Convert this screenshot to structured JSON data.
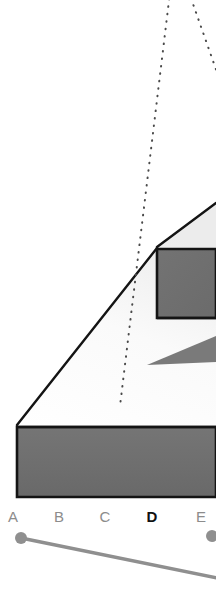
{
  "viewport": {
    "background_color": "#ffffff",
    "name": "3d-model-viewport"
  },
  "model": {
    "label": "extruded-ramp-solid",
    "outline_color": "#1a1a1a",
    "face_fill_dark": "#6f6f6f",
    "face_fill_light": "#f7f7f7",
    "wedge_fill": "#6f6f6f",
    "faces": [
      {
        "name": "front-base-face",
        "fill": "#6f6f6f",
        "points": "17,427 216,427 216,497 17,497"
      },
      {
        "name": "upper-step-face",
        "fill": "#6f6f6f",
        "points": "157,249 216,249 216,318 157,318"
      },
      {
        "name": "ramp-top-face",
        "fill": "#fbfbfb",
        "points": "17,424 157,247 216,202 216,425"
      },
      {
        "name": "inner-wedge",
        "fill": "#6f6f6f",
        "points": "147,365 216,337 216,361"
      }
    ]
  },
  "projection_lines": {
    "name": "dotted-projection-cone",
    "color": "#4a4a4a",
    "style": "dotted",
    "left_line": {
      "x1": 171,
      "y1": -14,
      "x2": 120,
      "y2": 406
    },
    "right_line": {
      "x1": 186,
      "y1": -14,
      "x2": 218,
      "y2": 76
    }
  },
  "axis": {
    "name": "horizontal-axis-labels",
    "active_label": "D",
    "labels": [
      {
        "text": "A",
        "x": 12,
        "active": false
      },
      {
        "text": "B",
        "x": 58,
        "active": false
      },
      {
        "text": "C",
        "x": 104,
        "active": false
      },
      {
        "text": "D",
        "x": 151,
        "active": true
      },
      {
        "text": "E",
        "x": 200,
        "active": false
      }
    ]
  },
  "slider": {
    "name": "range-slider",
    "track_color": "#8f8f8f",
    "handle_color": "#8f8f8f",
    "track": {
      "x1": 21,
      "y1": 10,
      "x2": 230,
      "y2": 52
    },
    "handles": [
      {
        "name": "slider-handle-start",
        "cx": 21,
        "cy": 10,
        "r": 6
      },
      {
        "name": "slider-handle-end",
        "cx": 212,
        "cy": 8,
        "r": 6
      }
    ]
  }
}
